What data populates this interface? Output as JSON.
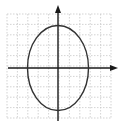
{
  "diagram": {
    "type": "ellipse-on-coordinate-grid",
    "grid": {
      "x_min": 7,
      "x_max": 111,
      "y_min": 14,
      "y_max": 118,
      "cells": 10,
      "color": "#c8c8c8",
      "style": "dotted"
    },
    "axes": {
      "color": "#1a1a1a",
      "x_axis": {
        "y": 68,
        "x_start": 8,
        "x_end": 118,
        "arrow": "right"
      },
      "y_axis": {
        "x": 58,
        "y_start": 121,
        "y_end": 5,
        "arrow": "up"
      }
    },
    "ellipse": {
      "cx": 58,
      "cy": 68,
      "rx": 30.5,
      "ry": 42.5,
      "stroke": "#333333",
      "orientation": "vertical-major"
    }
  }
}
